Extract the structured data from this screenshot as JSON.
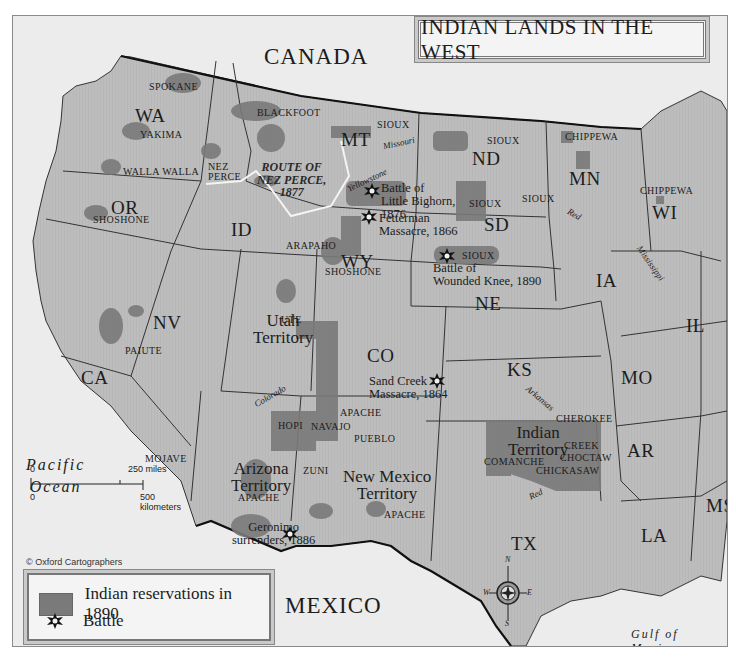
{
  "title": "INDIAN LANDS IN THE WEST",
  "credit": "© Oxford Cartographers",
  "legend": {
    "items": [
      {
        "symbol": "reservation-swatch",
        "label": "Indian reservations in 1890",
        "color": "#7a7a7a"
      },
      {
        "symbol": "battle-icon",
        "label": "Battle"
      }
    ]
  },
  "scale": {
    "miles_zero": "0",
    "miles_label": "250 miles",
    "km_zero": "0",
    "km_label": "500 kilometers"
  },
  "compass": {
    "n": "N",
    "s": "S",
    "e": "E",
    "w": "W"
  },
  "countries": [
    "CANADA",
    "MEXICO"
  ],
  "water": {
    "pacific": [
      "Pacific",
      "Ocean"
    ],
    "gulf": [
      "Gulf of",
      "Mexico"
    ]
  },
  "states": {
    "WA": "WA",
    "OR": "OR",
    "CA": "CA",
    "NV": "NV",
    "ID": "ID",
    "MT": "MT",
    "WY": "WY",
    "CO": "CO",
    "ND": "ND",
    "SD": "SD",
    "NE": "NE",
    "KS": "KS",
    "MN": "MN",
    "WI": "WI",
    "IA": "IA",
    "IL": "IL",
    "MO": "MO",
    "AR": "AR",
    "LA": "LA",
    "MS": "MS",
    "TX": "TX"
  },
  "territories": {
    "utah": [
      "Utah",
      "Territory"
    ],
    "arizona": [
      "Arizona",
      "Territory"
    ],
    "new_mexico": [
      "New Mexico",
      "Territory"
    ],
    "indian": [
      "Indian",
      "Territory"
    ]
  },
  "tribes": {
    "spokane": "SPOKANE",
    "yakima": "YAKIMA",
    "walla_walla": "WALLA WALLA",
    "nez_perce": [
      "NEZ",
      "PERCE"
    ],
    "shoshone_or": "SHOSHONE",
    "blackfoot": "BLACKFOOT",
    "sioux_mt": "SIOUX",
    "sioux_nd": "SIOUX",
    "sioux_sd1": "SIOUX",
    "sioux_sd2": "SIOUX",
    "sioux_sd3": "SIOUX",
    "chippewa_mn": "CHIPPEWA",
    "chippewa_wi": "CHIPPEWA",
    "arapaho": "ARAPAHO",
    "shoshone_wy": "SHOSHONE",
    "paiute": "PAIUTE",
    "ute": "UTE",
    "mojave": "MOJAVE",
    "hopi": "HOPI",
    "navajo": "NAVAJO",
    "apache_nm1": "APACHE",
    "pueblo": "PUEBLO",
    "zuni": "ZUNI",
    "apache_az": "APACHE",
    "apache_nm2": "APACHE",
    "cherokee": "CHEROKEE",
    "creek": "CREEK",
    "choctaw": "CHOCTAW",
    "chickasaw": "CHICKASAW",
    "comanche": "COMANCHE"
  },
  "rivers": {
    "missouri": "Missouri",
    "yellowstone": "Yellowstone",
    "red_mn": "Red",
    "mississippi": "Mississippi",
    "colorado": "Colorado",
    "arkansas": "Arkansas",
    "red_tx": "Red"
  },
  "route": [
    "ROUTE OF",
    "NEZ PERCE,",
    "1877"
  ],
  "battles": [
    {
      "name": [
        "Battle of",
        "Little Bighorn,",
        "1876"
      ]
    },
    {
      "name": [
        "Fetterman",
        "Massacre, 1866"
      ]
    },
    {
      "name": [
        "Battle of",
        "Wounded Knee, 1890"
      ]
    },
    {
      "name": [
        "Sand Creek",
        "Massacre, 1864"
      ]
    },
    {
      "name": [
        "Geronimo",
        "surrenders, 1886"
      ]
    }
  ],
  "colors": {
    "land": "#b9b9b9",
    "foreign": "#e8e8e8",
    "reservation": "#7a7a7a",
    "border": "#222222"
  }
}
